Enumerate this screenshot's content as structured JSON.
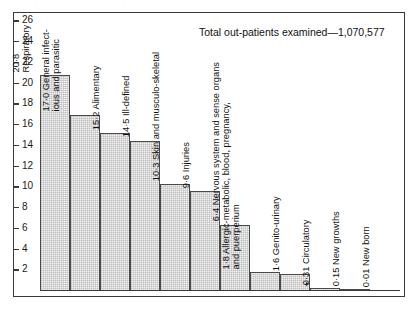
{
  "chart_data": {
    "type": "bar",
    "title": "Total out-patients examined—1,070,577",
    "xlabel": "",
    "ylabel": "",
    "ylim": [
      0,
      27
    ],
    "yticks": [
      2,
      4,
      6,
      8,
      10,
      12,
      14,
      16,
      18,
      20,
      22,
      24,
      26
    ],
    "grid": false,
    "legend": null,
    "categories": [
      "Respiratory",
      "General infectious and parasitic",
      "Alimentary",
      "Ill-defined",
      "Skin and musculo-skeletal",
      "Injuries",
      "Nervous system and sense organs",
      "Allergic-metabolic, blood, pregnancy, and puerperium",
      "Genito-urinary",
      "Circulatory",
      "New growths",
      "New born"
    ],
    "values": [
      20.8,
      17.0,
      15.2,
      14.5,
      10.3,
      9.6,
      6.4,
      1.8,
      1.6,
      0.31,
      0.15,
      0.01
    ],
    "value_labels": [
      "20·8",
      "17·0",
      "15·2",
      "14·5",
      "10·3",
      "9·6",
      "6·4",
      "1·8",
      "1·6",
      "0·31",
      "0·15",
      "0·01"
    ],
    "bar_labels": [
      {
        "line1": "20·8",
        "line2": "Respiratory"
      },
      {
        "line1": "17·0 General infect-",
        "line2": "ious and parasitic"
      },
      {
        "line1": "15·2 Alimentary",
        "line2": ""
      },
      {
        "line1": "14·5 Ill-defined",
        "line2": ""
      },
      {
        "line1": "10·3 Skin and musculo-skeletal",
        "line2": ""
      },
      {
        "line1": "9·6 Injuries",
        "line2": ""
      },
      {
        "line1": "6·4 Nervous system and sense organs",
        "line2": ""
      },
      {
        "line1": "1·8 Allergic-metabolic, blood, pregnancy,",
        "line2": "and puerperium"
      },
      {
        "line1": "1·6 Genito-urinary",
        "line2": ""
      },
      {
        "line1": "0·31 Circulatory",
        "line2": ""
      },
      {
        "line1": "0·15 New growths",
        "line2": ""
      },
      {
        "line1": "0·01 New born",
        "line2": ""
      }
    ],
    "colors": {
      "bar_fill": "#f2f2f2",
      "bar_stroke": "#4a4a4a",
      "axis": "#3a3a3a",
      "text": "#111111",
      "background": "#ffffff"
    }
  },
  "scan_artifact": {
    "text": "·  ·   ·  ·     ·   ·    ·  ·   ·"
  }
}
